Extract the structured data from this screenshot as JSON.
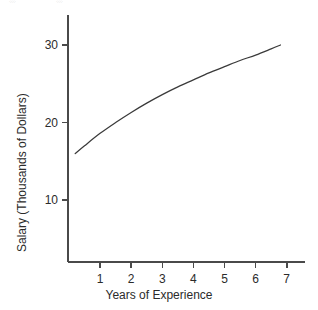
{
  "figure": {
    "background_color": "#ffffff",
    "line_color": "#3a3a3a",
    "axis_color": "#4a4a4a",
    "text_color": "#2b2b2b",
    "caption_remnant_left": "░",
    "caption_remnant_right": "░"
  },
  "chart_data": {
    "type": "line",
    "title": "",
    "subtitle": "",
    "xlabel": "Years of Experience",
    "ylabel": "Salary (Thousands of Dollars)",
    "xlim": [
      0,
      7.6
    ],
    "ylim": [
      0,
      33
    ],
    "xticks": [
      1,
      2,
      3,
      4,
      5,
      6,
      7
    ],
    "xtick_labels": [
      "1",
      "2",
      "3",
      "4",
      "5",
      "6",
      "7"
    ],
    "yticks": [
      10,
      20,
      30
    ],
    "ytick_labels": [
      "10",
      "20",
      "30"
    ],
    "grid": false,
    "legend": null,
    "annotations": [],
    "series": [
      {
        "name": "Salary vs. experience",
        "x": [
          0.2,
          0.5,
          1.0,
          1.5,
          2.0,
          2.5,
          3.0,
          3.5,
          4.0,
          4.5,
          5.0,
          5.5,
          6.0,
          6.5,
          6.8
        ],
        "y": [
          16.0,
          17.0,
          18.6,
          20.0,
          21.3,
          22.5,
          23.6,
          24.6,
          25.5,
          26.4,
          27.2,
          28.0,
          28.7,
          29.5,
          30.0
        ]
      }
    ]
  }
}
